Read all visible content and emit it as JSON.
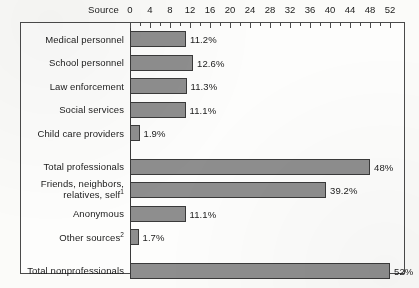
{
  "chart_data": {
    "type": "bar",
    "orientation": "horizontal",
    "title": "",
    "xlabel": "",
    "ylabel": "Source",
    "source_header": "Source",
    "xlim": [
      0,
      52
    ],
    "xticks": [
      0,
      4,
      8,
      12,
      16,
      20,
      24,
      28,
      32,
      36,
      40,
      44,
      48,
      52
    ],
    "xtick_labels": [
      "0",
      "4",
      "8",
      "12",
      "16",
      "20",
      "24",
      "28",
      "32",
      "36",
      "40",
      "44",
      "48",
      "52"
    ],
    "minor_tick_step": 2,
    "grid": false,
    "legend": false,
    "bar_fill_color": "#8e8e8e",
    "bar_edge_color": "#3a3a3a",
    "categories": [
      "Medical personnel",
      "School personnel",
      "Law enforcement",
      "Social services",
      "Child care providers",
      "Total professionals",
      "Friends, neighbors, relatives, self",
      "Anonymous",
      "Other sources",
      "Total nonprofessionals"
    ],
    "values": [
      11.2,
      12.6,
      11.3,
      11.1,
      1.9,
      48,
      39.2,
      11.1,
      1.7,
      52
    ],
    "value_labels": [
      "11.2%",
      "12.6%",
      "11.3%",
      "11.1%",
      "1.9%",
      "48%",
      "39.2%",
      "11.1%",
      "1.7%",
      "52%"
    ],
    "bars": [
      {
        "label": "Medical personnel",
        "label_line2": "",
        "footnote": "",
        "value": 11.2,
        "value_label": "11.2%",
        "group": "professional"
      },
      {
        "label": "School personnel",
        "label_line2": "",
        "footnote": "",
        "value": 12.6,
        "value_label": "12.6%",
        "group": "professional"
      },
      {
        "label": "Law enforcement",
        "label_line2": "",
        "footnote": "",
        "value": 11.3,
        "value_label": "11.3%",
        "group": "professional"
      },
      {
        "label": "Social services",
        "label_line2": "",
        "footnote": "",
        "value": 11.1,
        "value_label": "11.1%",
        "group": "professional"
      },
      {
        "label": "Child care providers",
        "label_line2": "",
        "footnote": "",
        "value": 1.9,
        "value_label": "1.9%",
        "group": "professional"
      },
      {
        "label": "Total professionals",
        "label_line2": "",
        "footnote": "",
        "value": 48,
        "value_label": "48%",
        "group": "total"
      },
      {
        "label": "Friends, neighbors,",
        "label_line2": "relatives, self",
        "footnote": "1",
        "value": 39.2,
        "value_label": "39.2%",
        "group": "nonprofessional"
      },
      {
        "label": "Anonymous",
        "label_line2": "",
        "footnote": "",
        "value": 11.1,
        "value_label": "11.1%",
        "group": "nonprofessional"
      },
      {
        "label": "Other sources",
        "label_line2": "",
        "footnote": "2",
        "value": 1.7,
        "value_label": "1.7%",
        "group": "nonprofessional"
      },
      {
        "label": "Total nonprofessionals",
        "label_line2": "",
        "footnote": "",
        "value": 52,
        "value_label": "52%",
        "group": "total"
      }
    ]
  }
}
